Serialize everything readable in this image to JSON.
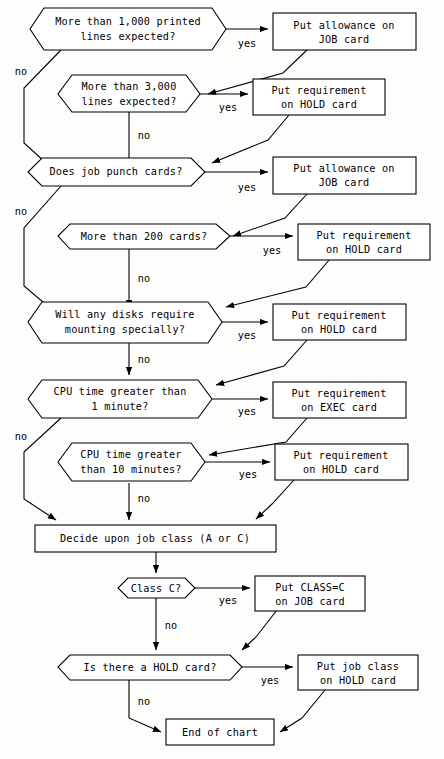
{
  "diagram": {
    "type": "flowchart",
    "colors": {
      "stroke": "#000000",
      "fill": "#ffffff",
      "background": "#fdfdfc"
    },
    "edge_labels": {
      "yes": "yes",
      "no": "no"
    },
    "nodes": [
      {
        "id": "d1",
        "shape": "hexagon",
        "lines": [
          "More than 1,000 printed",
          "lines expected?"
        ]
      },
      {
        "id": "a1",
        "shape": "rect",
        "lines": [
          "Put allowance on",
          "JOB card"
        ]
      },
      {
        "id": "d2",
        "shape": "hexagon",
        "lines": [
          "More than 3,000",
          "lines expected?"
        ]
      },
      {
        "id": "a2",
        "shape": "rect",
        "lines": [
          "Put requirement",
          "on HOLD card"
        ]
      },
      {
        "id": "d3",
        "shape": "hexagon",
        "lines": [
          "Does job punch cards?"
        ]
      },
      {
        "id": "a3",
        "shape": "rect",
        "lines": [
          "Put allowance on",
          "JOB card"
        ]
      },
      {
        "id": "d4",
        "shape": "hexagon",
        "lines": [
          "More than 200 cards?"
        ]
      },
      {
        "id": "a4",
        "shape": "rect",
        "lines": [
          "Put requirement",
          "on HOLD card"
        ]
      },
      {
        "id": "d5",
        "shape": "hexagon",
        "lines": [
          "Will any disks require",
          "mounting specially?"
        ]
      },
      {
        "id": "a5",
        "shape": "rect",
        "lines": [
          "Put requirement",
          "on HOLD card"
        ]
      },
      {
        "id": "d6",
        "shape": "hexagon",
        "lines": [
          "CPU time greater than",
          "1 minute?"
        ]
      },
      {
        "id": "a6",
        "shape": "rect",
        "lines": [
          "Put requirement",
          "on EXEC card"
        ]
      },
      {
        "id": "d7",
        "shape": "hexagon",
        "lines": [
          "CPU time greater",
          "than 10 minutes?"
        ]
      },
      {
        "id": "a7",
        "shape": "rect",
        "lines": [
          "Put requirement",
          "on HOLD card"
        ]
      },
      {
        "id": "p1",
        "shape": "rect",
        "lines": [
          "Decide upon job class (A or C)"
        ]
      },
      {
        "id": "d8",
        "shape": "hexagon",
        "lines": [
          "Class C?"
        ]
      },
      {
        "id": "a8",
        "shape": "rect",
        "lines": [
          "Put  CLASS=C",
          "on JOB card"
        ]
      },
      {
        "id": "d9",
        "shape": "hexagon",
        "lines": [
          "Is there a HOLD card?"
        ]
      },
      {
        "id": "a9",
        "shape": "rect",
        "lines": [
          "Put job class",
          "on HOLD card"
        ]
      },
      {
        "id": "end",
        "shape": "rect",
        "lines": [
          "End of chart"
        ]
      }
    ]
  }
}
